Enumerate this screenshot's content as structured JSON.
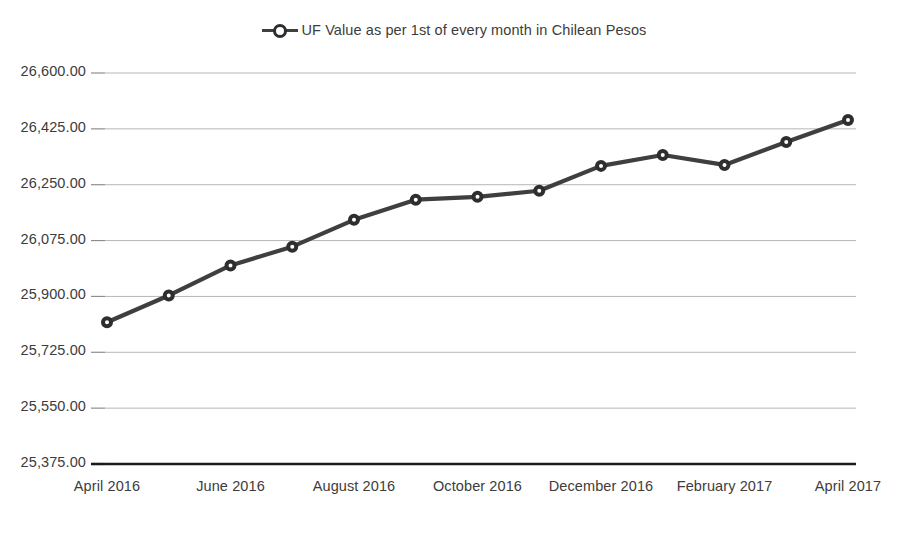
{
  "chart_data": {
    "type": "line",
    "title": "",
    "xlabel": "",
    "ylabel": "",
    "grid": true,
    "legend_position": "top-center",
    "series": [
      {
        "name": "UF Value as per 1st of every month in Chilean Pesos",
        "marker": "circle-open",
        "color": "#3f3f3f",
        "values": [
          25819.0,
          25903.0,
          25997.0,
          26056.0,
          26140.0,
          26203.0,
          26212.0,
          26231.0,
          26309.0,
          26343.0,
          26312.0,
          26384.0,
          26453.0
        ]
      }
    ],
    "categories": [
      "April 2016",
      "May 2016",
      "June 2016",
      "July 2016",
      "August 2016",
      "September 2016",
      "October 2016",
      "November 2016",
      "December 2016",
      "January 2017",
      "February 2017",
      "March 2017",
      "April 2017"
    ],
    "x_tick_labels": [
      "April 2016",
      "June 2016",
      "August 2016",
      "October 2016",
      "December 2016",
      "February 2017",
      "April 2017"
    ],
    "x_tick_indices": [
      0,
      2,
      4,
      6,
      8,
      10,
      12
    ],
    "y_tick_labels": [
      "26,600.00",
      "26,425.00",
      "26,250.00",
      "26,075.00",
      "25,900.00",
      "25,725.00",
      "25,550.00",
      "25,375.00"
    ],
    "y_tick_values": [
      26600,
      26425,
      26250,
      26075,
      25900,
      25725,
      25550,
      25375
    ],
    "ylim": [
      25375,
      26600
    ],
    "y_step": 175,
    "colors": {
      "line": "#3f3f3f",
      "marker_stroke": "#2e2e2e",
      "marker_fill": "#ffffff",
      "gridline": "#b6b6b6",
      "axis": "#1b1b1b",
      "text": "#3c3c3c",
      "background": "#ffffff"
    }
  },
  "legend": {
    "label": "UF Value as per 1st of every month in Chilean Pesos"
  }
}
